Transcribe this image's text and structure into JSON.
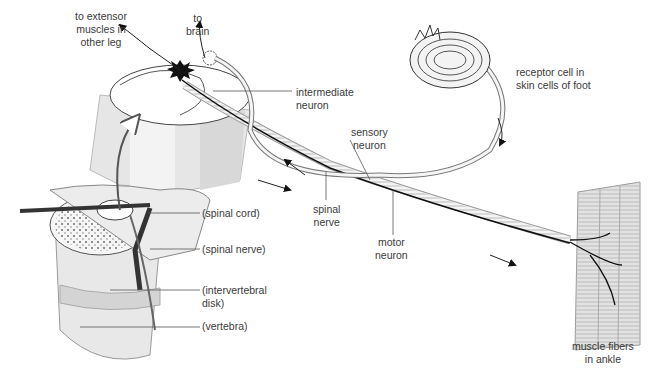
{
  "diagram": {
    "type": "anatomical-illustration",
    "colors": {
      "line": "#3a3a3a",
      "fill_light": "#e8e8e8",
      "fill_mid": "#c8c8c8",
      "neuron_dark": "#111111",
      "background": "#ffffff"
    }
  },
  "labels": {
    "extensor": "to extensor\nmuscles in\nother leg",
    "brain": "to\nbrain",
    "intermediate": "intermediate\nneuron",
    "receptor": "receptor cell in\nskin cells of foot",
    "sensory": "sensory\nneuron",
    "spinal_nerve_main": "spinal\nnerve",
    "motor": "motor\nneuron",
    "spinal_cord_paren": "(spinal cord)",
    "spinal_nerve_paren": "(spinal nerve)",
    "intervertebral": "(intervertebral\ndisk)",
    "vertebra": "(vertebra)",
    "muscle": "muscle fibers\nin ankle"
  }
}
